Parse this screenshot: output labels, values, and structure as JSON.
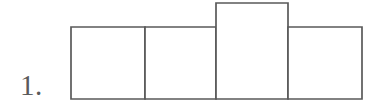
{
  "figure": {
    "label": "1.",
    "caption_number": "1",
    "kind": "bar-row-diagram",
    "background_color": "#ffffff",
    "line_color": "#5a5a5a",
    "fill_color": "#ffffff",
    "line_width_px": 1.7
  },
  "chart_data": {
    "type": "bar",
    "title": "",
    "subtitle": "",
    "xlabel": "",
    "ylabel": "",
    "grid": false,
    "legend": "none",
    "axis_visible": false,
    "tick_labels": [],
    "annotations": [
      "1."
    ],
    "baseline_y_px": 99,
    "categories": [
      "1",
      "2",
      "3",
      "4"
    ],
    "values": [
      72,
      72,
      96,
      72
    ],
    "value_unit": "px-height",
    "ylim": [
      0,
      96
    ],
    "bars": [
      {
        "name": "bar-1",
        "x": 71,
        "y": 27,
        "width": 74,
        "height": 72,
        "value": 72
      },
      {
        "name": "bar-2",
        "x": 145,
        "y": 27,
        "width": 71,
        "height": 72,
        "value": 72
      },
      {
        "name": "bar-3",
        "x": 216,
        "y": 3,
        "width": 72,
        "height": 96,
        "value": 96
      },
      {
        "name": "bar-4",
        "x": 288,
        "y": 27,
        "width": 74,
        "height": 72,
        "value": 72
      }
    ]
  }
}
